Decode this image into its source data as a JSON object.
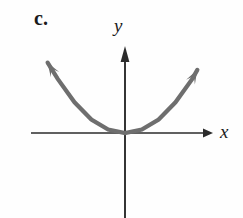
{
  "figure": {
    "part_label": "c.",
    "background_color": "#fefefe",
    "width": 243,
    "height": 218
  },
  "axes": {
    "x_label": "x",
    "y_label": "y",
    "axis_color": "#2b2b2b",
    "origin": {
      "x": 0,
      "y": 0
    },
    "x_axis": {
      "pixel_y": 133,
      "pixel_x_start": 31,
      "pixel_x_end": 211,
      "arrow_at_end": true,
      "arrow_at_start": false
    },
    "y_axis": {
      "pixel_x": 125,
      "pixel_y_start": 50,
      "pixel_y_end": 218,
      "arrow_at_top": true,
      "arrow_at_bottom": false
    },
    "ticks": [],
    "grid": false
  },
  "chart_data": {
    "type": "line",
    "title": "c.",
    "xlabel": "x",
    "ylabel": "y",
    "curve_name": "upward-opening parabola",
    "equation": "y = a*x^2, a > 0",
    "vertex": {
      "x": 0,
      "y": 0
    },
    "opens": "up",
    "tangent_to_x_axis_at_vertex": true,
    "stroke_color": "#6e6e6e",
    "stroke_width": 4.2,
    "arrowheads": [
      "left-end",
      "right-end"
    ],
    "x": [
      -4.6,
      -4.0,
      -3.0,
      -2.0,
      -1.0,
      0.0,
      1.0,
      2.0,
      3.0,
      4.0,
      4.3
    ],
    "y": [
      3.9,
      3.0,
      1.7,
      0.75,
      0.19,
      0.0,
      0.19,
      0.75,
      1.7,
      3.0,
      3.5
    ],
    "xlim": [
      -5.2,
      5.5
    ],
    "ylim": [
      -3.3,
      4.6
    ],
    "legend": null,
    "annotations": []
  }
}
